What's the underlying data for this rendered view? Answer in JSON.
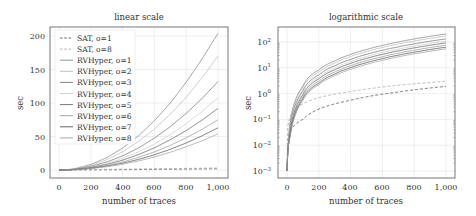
{
  "chart_data": [
    {
      "type": "line",
      "title": "linear scale",
      "xlabel": "number of traces",
      "ylabel": "sec",
      "xlim": [
        -50,
        1050
      ],
      "ylim": [
        -15,
        210
      ],
      "xticks": [
        0,
        200,
        400,
        600,
        800,
        1000
      ],
      "xtick_labels": [
        "0",
        "200",
        "400",
        "600",
        "800",
        "1,000"
      ],
      "yticks": [
        0,
        50,
        100,
        150,
        200
      ],
      "ytick_labels": [
        "0",
        "50",
        "100",
        "150",
        "200"
      ],
      "grid": true,
      "legend_position": "upper left",
      "x": [
        0,
        100,
        200,
        300,
        400,
        500,
        600,
        700,
        800,
        900,
        1000
      ],
      "series": [
        {
          "name": "SAT, o=1",
          "style": "dashed",
          "color": "#555555",
          "values": [
            0.001,
            0.1,
            0.25,
            0.4,
            0.55,
            0.75,
            0.95,
            1.15,
            1.4,
            1.65,
            1.9
          ]
        },
        {
          "name": "SAT, o=8",
          "style": "dashed",
          "color": "#aaaaaa",
          "values": [
            0.001,
            0.4,
            0.7,
            0.95,
            1.2,
            1.5,
            1.8,
            2.1,
            2.4,
            2.7,
            3.0
          ]
        },
        {
          "name": "RVHyper, o=1",
          "style": "solid",
          "color": "#888888",
          "values": [
            0.001,
            2.0,
            8.2,
            18.4,
            32.7,
            51,
            73.5,
            100,
            131,
            166,
            204
          ]
        },
        {
          "name": "RVHyper, o=2",
          "style": "solid",
          "color": "#bbbbbb",
          "values": [
            0.001,
            1.7,
            6.8,
            15.3,
            27.2,
            42.5,
            61.2,
            83.3,
            108.8,
            137.7,
            170
          ]
        },
        {
          "name": "RVHyper, o=3",
          "style": "solid",
          "color": "#777777",
          "values": [
            0.001,
            1.3,
            5.3,
            11.9,
            21.1,
            33,
            47.5,
            64.7,
            84.5,
            106.9,
            132
          ]
        },
        {
          "name": "RVHyper, o=4",
          "style": "solid",
          "color": "#cccccc",
          "values": [
            0.001,
            1.1,
            4.3,
            9.7,
            17.3,
            27,
            38.9,
            52.9,
            69.1,
            87.5,
            108
          ]
        },
        {
          "name": "RVHyper, o=5",
          "style": "solid",
          "color": "#666666",
          "values": [
            0.001,
            0.9,
            3.7,
            8.3,
            14.7,
            23,
            33.1,
            45.1,
            58.9,
            74.5,
            92
          ]
        },
        {
          "name": "RVHyper, o=6",
          "style": "solid",
          "color": "#999999",
          "values": [
            0.001,
            0.75,
            3.0,
            6.8,
            12,
            18.8,
            27,
            36.8,
            48,
            60.8,
            75
          ]
        },
        {
          "name": "RVHyper, o=7",
          "style": "solid",
          "color": "#555555",
          "values": [
            0.001,
            0.63,
            2.5,
            5.7,
            10.1,
            15.8,
            22.7,
            30.9,
            40.3,
            51,
            63
          ]
        },
        {
          "name": "RVHyper, o=8",
          "style": "solid",
          "color": "#a0a0a0",
          "values": [
            0.001,
            0.54,
            2.2,
            4.9,
            8.6,
            13.5,
            19.4,
            26.5,
            34.6,
            43.7,
            54
          ]
        }
      ]
    },
    {
      "type": "line",
      "title": "logarithmic scale",
      "xlabel": "number of traces",
      "ylabel": "sec",
      "yscale": "log",
      "xlim": [
        -50,
        1050
      ],
      "ylim": [
        0.0005,
        300
      ],
      "xticks": [
        0,
        200,
        400,
        600,
        800,
        1000
      ],
      "xtick_labels": [
        "0",
        "200",
        "400",
        "600",
        "800",
        "1,000"
      ],
      "yticks": [
        0.001,
        0.01,
        0.1,
        1,
        10,
        100
      ],
      "ytick_labels": [
        "10^-3",
        "10^-2",
        "10^-1",
        "10^0",
        "10^1",
        "10^2"
      ],
      "grid": true,
      "note": "same series as linear scale plot"
    }
  ],
  "left": {
    "title": "linear scale",
    "xlabel": "number of traces",
    "ylabel": "sec",
    "xticks": [
      "0",
      "200",
      "400",
      "600",
      "800",
      "1,000"
    ],
    "yticks": [
      "0",
      "50",
      "100",
      "150",
      "200"
    ],
    "legend": [
      "SAT, o=1",
      "SAT, o=8",
      "RVHyper, o=1",
      "RVHyper, o=2",
      "RVHyper, o=3",
      "RVHyper, o=4",
      "RVHyper, o=5",
      "RVHyper, o=6",
      "RVHyper, o=7",
      "RVHyper, o=8"
    ]
  },
  "right": {
    "title": "logarithmic scale",
    "xlabel": "number of traces",
    "ylabel": "sec",
    "xticks": [
      "0",
      "200",
      "400",
      "600",
      "800",
      "1,000"
    ],
    "ytick_bases": [
      "10",
      "10",
      "10",
      "10",
      "10",
      "10"
    ],
    "ytick_exps": [
      "−3",
      "−2",
      "−1",
      "0",
      "1",
      "2"
    ]
  }
}
